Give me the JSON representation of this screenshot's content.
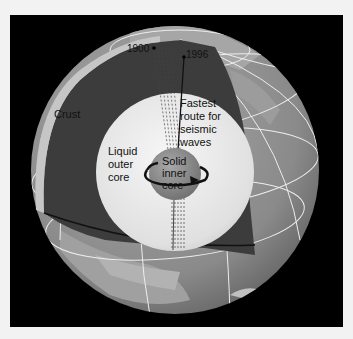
{
  "diagram": {
    "labels": {
      "year_1900": "1900",
      "year_1996": "1996",
      "crust": "Crust",
      "fastest_route": [
        "Fastest",
        "route for",
        "seismic",
        "waves"
      ],
      "outer_core": [
        "Liquid",
        "outer",
        "core"
      ],
      "inner_core": [
        "Solid",
        "inner",
        "core"
      ]
    },
    "colors": {
      "background": "#000000",
      "page": "#f2f2f2",
      "ocean": "#8a8a8a",
      "land": "#b4b4b4",
      "mantle": "#3a3a3a",
      "outer_core": "#e6e6e6",
      "inner_core": "#8c8c8c",
      "grid": "#f0f0f0"
    }
  }
}
